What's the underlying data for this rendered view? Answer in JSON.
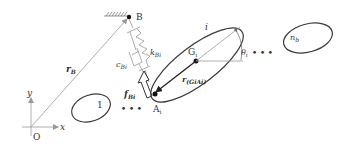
{
  "diagram": {
    "colors": {
      "line": "#3a3a3a",
      "guide": "#9a9a9a",
      "text": "#333333",
      "point": "#111111",
      "background": "#ffffff"
    },
    "origin": {
      "label": "O"
    },
    "axes": {
      "x_label": "x",
      "y_label": "y"
    },
    "anchor": {
      "label": "B",
      "icon": "ground-hatch-icon"
    },
    "position_vector_B": {
      "label": "r",
      "sub": "B"
    },
    "spring": {
      "label": "k",
      "sub": "Bi"
    },
    "damper": {
      "label": "c",
      "sub": "Bi"
    },
    "force": {
      "label": "f",
      "sub": "Bi"
    },
    "attachment_point": {
      "label": "A",
      "sub": "i"
    },
    "relative_vector": {
      "label": "r",
      "sub": "(GiAi)"
    },
    "center_of_mass": {
      "label": "G",
      "sub": "i"
    },
    "body_i": {
      "label": "i"
    },
    "angle": {
      "label": "θ",
      "sub": "i"
    },
    "body_1": {
      "label": "1"
    },
    "body_n": {
      "label": "n",
      "sub": "b"
    },
    "ellipsis_left": "• • •",
    "ellipsis_right": "• • •"
  }
}
